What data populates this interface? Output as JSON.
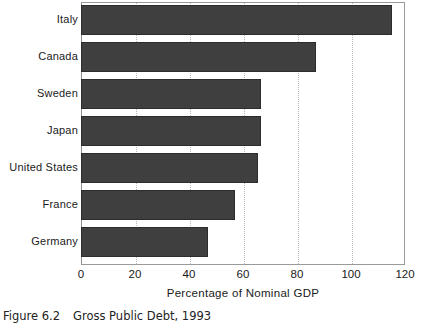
{
  "caption": {
    "figure_number": "Figure 6.2",
    "figure_title": "Gross Public Debt, 1993"
  },
  "chart_data": {
    "type": "bar",
    "orientation": "horizontal",
    "title": "Gross Public Debt, 1993",
    "xlabel": "Percentage of Nominal GDP",
    "ylabel": "",
    "categories": [
      "Italy",
      "Canada",
      "Sweden",
      "Japan",
      "United States",
      "France",
      "Germany"
    ],
    "values": [
      115,
      87,
      66.5,
      66.5,
      65.5,
      57,
      47
    ],
    "xlim": [
      0,
      120
    ],
    "xticks": [
      0,
      20,
      40,
      60,
      80,
      100,
      120
    ],
    "xtick_labels": [
      "0",
      "20",
      "40",
      "60",
      "80",
      "100",
      "120"
    ],
    "gridlines": {
      "x": [
        20,
        40,
        60,
        80,
        100
      ],
      "style": "dotted",
      "y": false
    },
    "legend": null,
    "bar_color": "#3f3f3f",
    "bar_edge_color": "#2c2c2c",
    "grid_color": "#b9b9b9",
    "frame_color": "#9a9a9a"
  }
}
